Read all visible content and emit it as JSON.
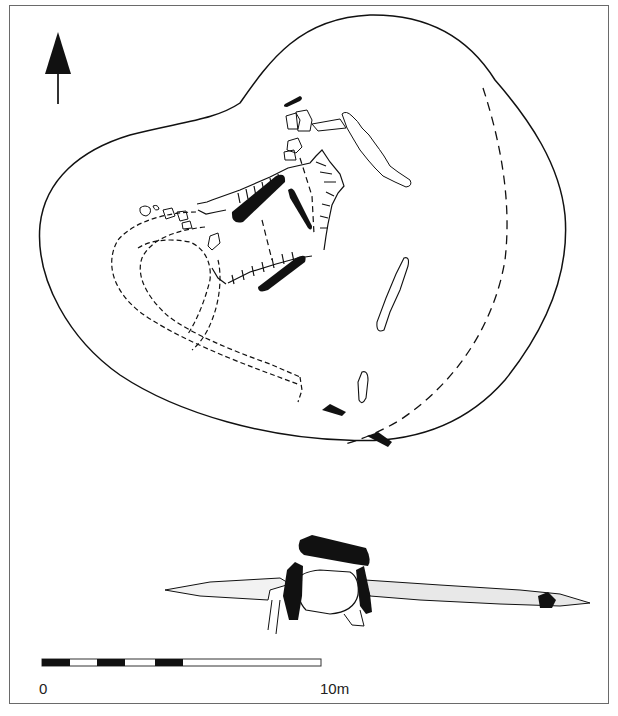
{
  "figure": {
    "type": "archaeological-site-plan",
    "views": [
      "plan",
      "section"
    ],
    "ink_color": "#111111",
    "fill_color": "#ffffff",
    "frame_color": "#6a6a6a"
  },
  "north_arrow": {
    "direction": "north",
    "icon": "north-arrow-icon"
  },
  "plan": {
    "outer_mound": "cairn outline (solid)",
    "inner_boundary": "dashed line (conjectural edge)",
    "features": [
      "capstone",
      "orthostats",
      "chamber",
      "kerb stones",
      "passage",
      "curving wall"
    ]
  },
  "section": {
    "features": [
      "capstone",
      "orthostats",
      "chamber void",
      "mound fill (stippled)",
      "outlying stone"
    ]
  },
  "scale_bar": {
    "start_label": "0",
    "end_label": "10m",
    "segments": [
      "black",
      "white",
      "black",
      "white",
      "black",
      "white"
    ]
  }
}
